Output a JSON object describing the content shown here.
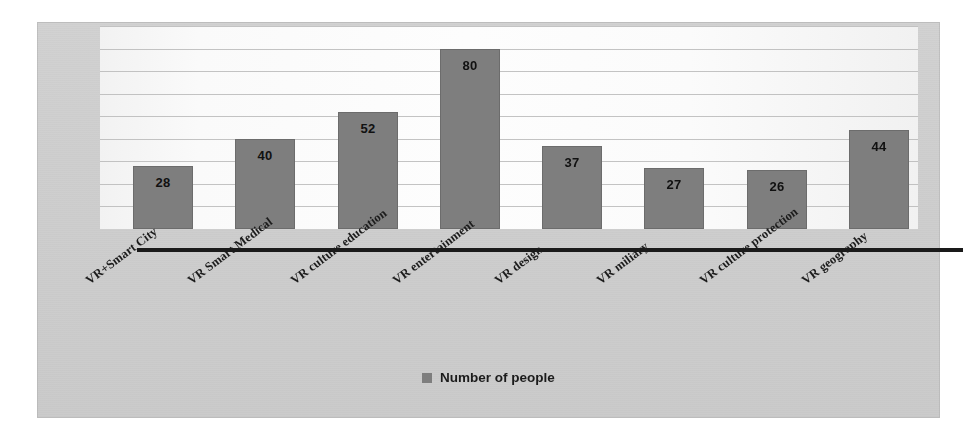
{
  "chart_data": {
    "type": "bar",
    "title": "",
    "xlabel": "",
    "ylabel": "",
    "ylim": [
      0,
      90
    ],
    "grid": true,
    "legend_position": "bottom",
    "legend": [
      "Number of people"
    ],
    "categories": [
      "VR+Smart City",
      "VR Smart Medical",
      "VR culture education",
      "VR entertainment",
      "VR design",
      "VR miliary",
      "VR culture protection",
      "VR geography"
    ],
    "series": [
      {
        "name": "Number of people",
        "values": [
          28,
          40,
          52,
          80,
          37,
          27,
          26,
          44
        ],
        "color": "#7e7e7e"
      }
    ],
    "data_labels": [
      "28",
      "40",
      "52",
      "80",
      "37",
      "27",
      "26",
      "44"
    ],
    "gridline_values": [
      10,
      20,
      30,
      40,
      50,
      60,
      70,
      80,
      90
    ]
  },
  "legend": {
    "swatch_name": "legend-color-swatch",
    "label": "Number of people",
    "color": "#7e7e7e"
  },
  "colors": {
    "bar": "#7e7e7e",
    "axis": "#1a1a1a",
    "gridline": "#b9b9b9",
    "panel_background": "#cfcfcf",
    "plot_background": "#fbfbfb",
    "label_text": "#1c1c1c"
  }
}
